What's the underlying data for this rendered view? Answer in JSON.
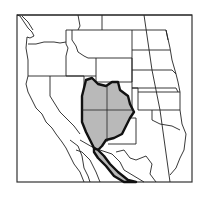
{
  "map": {
    "title": "",
    "region": "Western North America",
    "features": [
      "state-boundaries",
      "coastline",
      "species-range"
    ],
    "range": {
      "label": "",
      "fill_color": "#b9b9b9",
      "outline_color": "#111111"
    },
    "colors": {
      "background": "#ffffff",
      "land": "#ffffff",
      "lines": "#222222"
    }
  }
}
